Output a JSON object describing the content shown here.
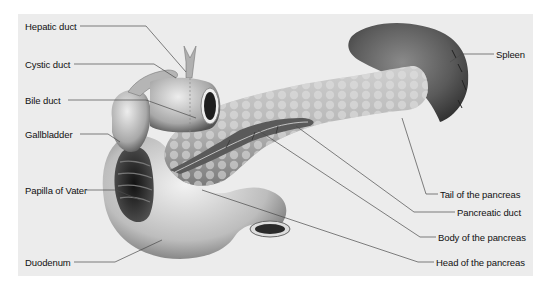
{
  "figure": {
    "type": "anatomical-diagram",
    "colors": {
      "background": "#ececec",
      "page": "#ffffff",
      "organ_light": "#d0d0d0",
      "organ_dark": "#3a3a3a",
      "leader_line": "#444444",
      "text": "#111111"
    }
  },
  "labels": {
    "left": [
      {
        "id": "hepatic-duct",
        "text": "Hepatic duct"
      },
      {
        "id": "cystic-duct",
        "text": "Cystic duct"
      },
      {
        "id": "bile-duct",
        "text": "Bile duct"
      },
      {
        "id": "gallbladder",
        "text": "Gallbladder"
      },
      {
        "id": "papilla-of-vater",
        "text": "Papilla of Vater"
      },
      {
        "id": "duodenum",
        "text": "Duodenum"
      }
    ],
    "right": [
      {
        "id": "spleen",
        "text": "Spleen"
      },
      {
        "id": "tail-of-pancreas",
        "text": "Tail of the pancreas"
      },
      {
        "id": "pancreatic-duct",
        "text": "Pancreatic duct"
      },
      {
        "id": "body-of-pancreas",
        "text": "Body of the pancreas"
      },
      {
        "id": "head-of-pancreas",
        "text": "Head of the pancreas"
      }
    ]
  }
}
